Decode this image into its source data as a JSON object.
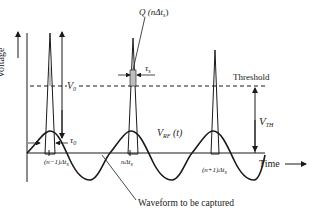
{
  "diagram": {
    "labels": {
      "y_axis": "Voltage",
      "x_axis": "Time",
      "threshold": "Threshold",
      "v0_main": "V",
      "v0_sub": "0",
      "vth_main": "V",
      "vth_sub": "TH",
      "vrf": "V",
      "vrf_sub": "RF",
      "vrf_arg": "(t)",
      "q_label": "Q (nΔt",
      "q_sub": "s",
      "q_close": ")",
      "tau_s": "τ",
      "tau_s_sub": "s",
      "tau_0": "τ",
      "tau_0_sub": "0",
      "tick_prev": "(n−1)Δt",
      "tick_prev_sub": "s",
      "tick_cur": "nΔt",
      "tick_cur_sub": "s",
      "tick_next": "(n+1)Δt",
      "tick_next_sub": "s",
      "waveform": "Waveform to be captured"
    },
    "colors": {
      "line": "#1a1a1a",
      "spike_fill": "#bdbdbd",
      "text": "#222222"
    }
  }
}
